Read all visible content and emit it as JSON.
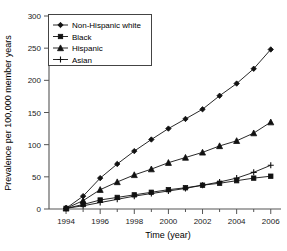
{
  "chart_data": {
    "type": "line",
    "title": "",
    "xlabel": "Time (year)",
    "ylabel": "Prevalence per 100,000 member years",
    "x": [
      1994,
      1995,
      1996,
      1997,
      1998,
      1999,
      2000,
      2001,
      2002,
      2003,
      2004,
      2005,
      2006
    ],
    "xlim": [
      1993,
      2006.6
    ],
    "ylim": [
      0,
      300
    ],
    "xticks": [
      1994,
      1996,
      1998,
      2000,
      2002,
      2004,
      2006
    ],
    "xticklabels": [
      "1994",
      "1996",
      "1998",
      "2000",
      "2002",
      "2004",
      "2006"
    ],
    "yticks": [
      0,
      50,
      100,
      150,
      200,
      250,
      300
    ],
    "yticklabels": [
      "0",
      "50",
      "100",
      "150",
      "200",
      "250",
      "300"
    ],
    "grid": false,
    "legend_position": "upper left",
    "series": [
      {
        "name": "Non-Hispanic white",
        "marker": "diamond",
        "color": "#111111",
        "values": [
          1,
          20,
          48,
          70,
          90,
          108,
          125,
          140,
          155,
          176,
          195,
          218,
          248
        ]
      },
      {
        "name": "Black",
        "marker": "square",
        "color": "#111111",
        "values": [
          1,
          7,
          14,
          18,
          22,
          26,
          30,
          33,
          37,
          40,
          44,
          48,
          51
        ]
      },
      {
        "name": "Hispanic",
        "marker": "triangle",
        "color": "#111111",
        "values": [
          1,
          13,
          30,
          42,
          53,
          62,
          72,
          80,
          88,
          98,
          106,
          118,
          135
        ]
      },
      {
        "name": "Asian",
        "marker": "plus",
        "color": "#111111",
        "values": [
          1,
          5,
          10,
          15,
          20,
          24,
          28,
          32,
          37,
          42,
          48,
          57,
          68
        ]
      }
    ]
  }
}
